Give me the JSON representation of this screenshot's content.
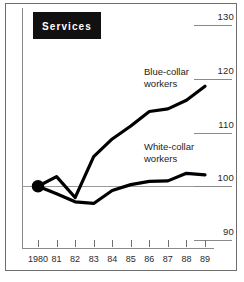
{
  "chart_data": {
    "type": "line",
    "title": "Services",
    "subtitle": "",
    "xlabel": "",
    "ylabel": "",
    "x": [
      1980,
      1981,
      1982,
      1983,
      1984,
      1985,
      1986,
      1987,
      1988,
      1989
    ],
    "xtick_labels": [
      "1980",
      "81",
      "82",
      "83",
      "84",
      "85",
      "86",
      "87",
      "88",
      "89"
    ],
    "ytick_labels": [
      "130",
      "120",
      "110",
      "100",
      "90"
    ],
    "ytick_values": [
      130,
      120,
      110,
      100,
      90
    ],
    "ylim": [
      90,
      130
    ],
    "xlim": [
      1980,
      1989
    ],
    "grid": false,
    "reference_line": 100,
    "legend_position": "inline-annotation",
    "origin_marker": {
      "x": 1980,
      "y": 100,
      "shape": "filled-circle"
    },
    "series": [
      {
        "name": "Blue-collar workers",
        "label_line1": "Blue-collar",
        "label_line2": "workers",
        "color": "#000000",
        "values": [
          100.0,
          101.8,
          97.9,
          105.5,
          108.8,
          111.2,
          113.9,
          114.4,
          116.0,
          118.6
        ]
      },
      {
        "name": "White-collar workers",
        "label_line1": "White-collar",
        "label_line2": "workers",
        "color": "#000000",
        "values": [
          100.0,
          98.6,
          97.1,
          96.8,
          99.2,
          100.3,
          100.9,
          101.0,
          102.4,
          102.1
        ]
      }
    ]
  },
  "figure": {
    "title_chip_label": "Services",
    "y_ticks": [
      {
        "label": "130",
        "value": 130
      },
      {
        "label": "120",
        "value": 120
      },
      {
        "label": "110",
        "value": 110
      },
      {
        "label": "100",
        "value": 100
      },
      {
        "label": "90",
        "value": 90
      }
    ],
    "x_ticks": [
      {
        "label": "1980",
        "value": 1980
      },
      {
        "label": "81",
        "value": 1981
      },
      {
        "label": "82",
        "value": 1982
      },
      {
        "label": "83",
        "value": 1983
      },
      {
        "label": "84",
        "value": 1984
      },
      {
        "label": "85",
        "value": 1985
      },
      {
        "label": "86",
        "value": 1986
      },
      {
        "label": "87",
        "value": 1987
      },
      {
        "label": "88",
        "value": 1988
      },
      {
        "label": "89",
        "value": 1889
      }
    ],
    "annotations": {
      "blue_l1": "Blue-collar",
      "blue_l2": "workers",
      "white_l1": "White-collar",
      "white_l2": "workers"
    },
    "colors": {
      "line": "#000000",
      "axis": "#8a8a8a",
      "frame": "#6e6e6e",
      "chip_bg": "#111111",
      "chip_fg": "#ffffff",
      "text": "#2a2a2a"
    }
  }
}
